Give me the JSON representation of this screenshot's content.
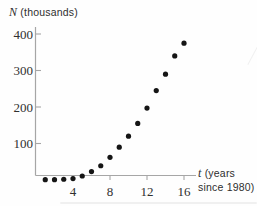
{
  "figure": {
    "y_axis_title": {
      "variable": "N",
      "unit": "(thousands)"
    },
    "x_axis_title": {
      "variable": "t",
      "unit_line1": "(years",
      "unit_line2": "since 1980)"
    }
  },
  "chart_data": {
    "type": "scatter",
    "title": "",
    "xlabel": "t (years since 1980)",
    "ylabel": "N (thousands)",
    "x": [
      1,
      2,
      3,
      4,
      5,
      6,
      7,
      8,
      9,
      10,
      11,
      12,
      13,
      14,
      15,
      16
    ],
    "y": [
      1,
      1,
      2,
      4,
      11,
      23,
      39,
      62,
      90,
      120,
      155,
      197,
      245,
      290,
      340,
      375
    ],
    "x_ticks": [
      4,
      8,
      12,
      16
    ],
    "y_ticks": [
      100,
      200,
      300,
      400
    ],
    "xlim": [
      0,
      17.3
    ],
    "ylim": [
      0,
      420
    ],
    "grid": false,
    "legend": null,
    "marker": "filled-circle",
    "marker_color": "#151515",
    "axis_color": "#a6a6a6",
    "tick_label_color": "#30302f",
    "background_color": "#fefefe"
  }
}
